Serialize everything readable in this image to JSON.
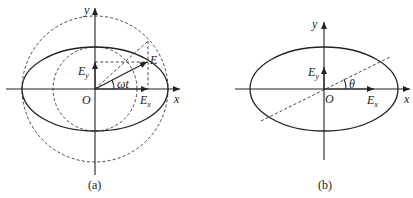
{
  "panels": [
    {
      "id": "a",
      "caption": "(a)",
      "labels": {
        "x": "x",
        "y": "y",
        "origin": "O",
        "ex": "E",
        "ex_sub": "x",
        "ey": "E",
        "ey_sub": "y",
        "e": "E",
        "angle": "ωt"
      }
    },
    {
      "id": "b",
      "caption": "(b)",
      "labels": {
        "x": "x",
        "y": "y",
        "origin": "O",
        "ex": "E",
        "ex_sub": "x",
        "ey": "E",
        "ey_sub": "y",
        "angle": "θ"
      }
    }
  ]
}
